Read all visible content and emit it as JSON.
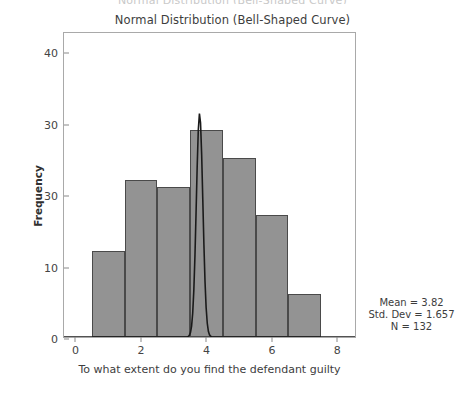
{
  "figure": {
    "clipped_header_text": "Normal Distribution (Bell-Shaped Curve)",
    "y_axis_title": "Frequency",
    "x_axis_title": "To what extent do you find the defendant guilty"
  },
  "chart_data": {
    "type": "bar",
    "title": "Normal Distribution (Bell-Shaped Curve)",
    "xlabel": "To what extent do you find the defendant guilty",
    "ylabel": "Frequency",
    "xlim": [
      -0.35,
      8.6
    ],
    "ylim": [
      0,
      42.8
    ],
    "grid": false,
    "legend": null,
    "bin_width": 1,
    "bin_edges": [
      0.5,
      1.5,
      2.5,
      3.5,
      4.5,
      5.5,
      6.5,
      7.5
    ],
    "bin_centers": [
      1,
      2,
      3,
      4,
      5,
      6,
      7
    ],
    "categories": [
      "1",
      "2",
      "3",
      "4",
      "5",
      "6",
      "7"
    ],
    "values": [
      12,
      22,
      21,
      29,
      25,
      17,
      6
    ],
    "xticks": [
      0,
      2,
      4,
      6,
      8
    ],
    "xtick_labels": [
      "0",
      "2",
      "4",
      "6",
      "8"
    ],
    "yticks": [
      0,
      10,
      20,
      30,
      40
    ],
    "ytick_labels": [
      "0",
      "10",
      "30",
      "30",
      "40"
    ],
    "overlay": {
      "type": "line",
      "name": "normal-curve",
      "peak_value": 31.5,
      "peak_x": 3.82,
      "color": "#1a1a1a"
    },
    "annotations": {
      "mean": "Mean = 3.82",
      "std_dev": "Std. Dev = 1.657",
      "n": "N = 132"
    },
    "colors": {
      "bar_fill": "#939393",
      "bar_edge": "#4a4a4a",
      "curve": "#1a1a1a",
      "axis": "#a9a9a9",
      "text": "#3d3d3d"
    }
  }
}
